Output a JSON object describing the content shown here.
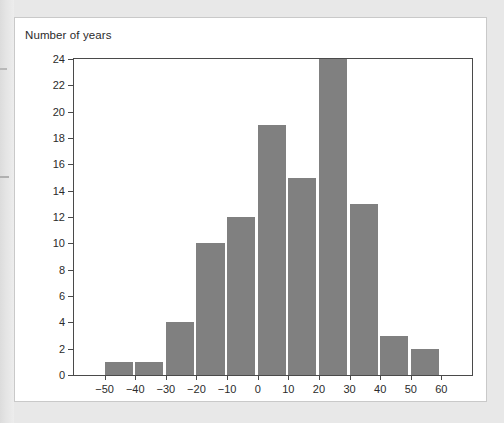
{
  "figure": {
    "title": "Number of years"
  },
  "colors": {
    "bar": "#808080",
    "frame": "#4a4a4a",
    "plot_background": "#ffffff",
    "panel_background": "#ffffff",
    "page_background": "#e8e8e8",
    "text": "#2b2b2b"
  },
  "chart_data": {
    "type": "bar",
    "title": "Number of years",
    "xlabel": "",
    "ylabel": "Number of years",
    "categories": [
      "-50 to -40",
      "-40 to -30",
      "-30 to -20",
      "-20 to -10",
      "-10 to 0",
      "0 to 10",
      "10 to 20",
      "20 to 30",
      "30 to 40",
      "40 to 50",
      "50 to 60"
    ],
    "bin_edges": [
      -50,
      -40,
      -30,
      -20,
      -10,
      0,
      10,
      20,
      30,
      40,
      50,
      60
    ],
    "values": [
      1,
      1,
      4,
      10,
      12,
      19,
      15,
      24,
      13,
      3,
      2
    ],
    "xlim": [
      -60,
      70
    ],
    "ylim": [
      0,
      24
    ],
    "xticks": [
      -50,
      -40,
      -30,
      -20,
      -10,
      0,
      10,
      20,
      30,
      40,
      50,
      60
    ],
    "xtick_labels": [
      "−50",
      "−40",
      "−30",
      "−20",
      "−10",
      "0",
      "10",
      "20",
      "30",
      "40",
      "50",
      "60"
    ],
    "yticks": [
      0,
      2,
      4,
      6,
      8,
      10,
      12,
      14,
      16,
      18,
      20,
      22,
      24
    ],
    "ytick_labels": [
      "0",
      "2",
      "4",
      "6",
      "8",
      "10",
      "12",
      "14",
      "16",
      "18",
      "20",
      "22",
      "24"
    ],
    "grid": false,
    "legend": false
  }
}
